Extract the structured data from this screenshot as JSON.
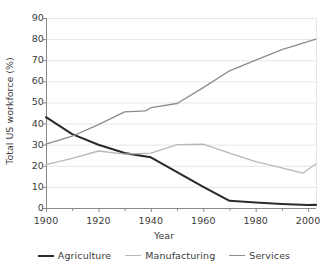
{
  "chart_data": {
    "type": "line",
    "title": "",
    "xlabel": "Year",
    "ylabel": "Total US workforce (%)",
    "xlim": [
      1900,
      2003
    ],
    "ylim": [
      0,
      90
    ],
    "xticks": [
      1900,
      1920,
      1940,
      1960,
      1980,
      2000
    ],
    "yticks": [
      0,
      10,
      20,
      30,
      40,
      50,
      60,
      70,
      80,
      90
    ],
    "grid": "horizontal",
    "legend_position": "bottom",
    "series": [
      {
        "name": "Agriculture",
        "color": "#2b2b2b",
        "width": 2.1,
        "x": [
          1900,
          1910,
          1920,
          1930,
          1940,
          1950,
          1960,
          1970,
          1980,
          1990,
          2000,
          2003
        ],
        "values": [
          43,
          35,
          30,
          26,
          24,
          17,
          10,
          3.4,
          2.6,
          1.9,
          1.4,
          1.5
        ]
      },
      {
        "name": "Manufacturing",
        "color": "#b8b8b8",
        "width": 1.3,
        "x": [
          1900,
          1910,
          1920,
          1930,
          1940,
          1950,
          1960,
          1970,
          1980,
          1990,
          1998,
          2003
        ],
        "values": [
          20.5,
          23.5,
          27,
          25.5,
          26,
          30,
          30.2,
          26,
          22,
          19,
          16.5,
          21
        ]
      },
      {
        "name": "Services",
        "color": "#8c8c8c",
        "width": 1.3,
        "x": [
          1900,
          1910,
          1920,
          1930,
          1938,
          1940,
          1950,
          1960,
          1970,
          1980,
          1990,
          2003
        ],
        "values": [
          30.2,
          34,
          39.5,
          45.5,
          46,
          47.5,
          49.5,
          57,
          65,
          70,
          75,
          80
        ]
      }
    ]
  },
  "axes": {
    "y_tick_labels": [
      "90",
      "80",
      "70",
      "60",
      "50",
      "40",
      "30",
      "20",
      "10",
      "0"
    ],
    "x_tick_labels": [
      "1900",
      "1920",
      "1940",
      "1960",
      "1980",
      "2000"
    ],
    "y_axis_title": "Total US workforce (%)",
    "x_axis_title": "Year"
  },
  "legend": {
    "items": [
      {
        "label": "Agriculture",
        "color": "#2b2b2b",
        "width": 2.1
      },
      {
        "label": "Manufacturing",
        "color": "#b8b8b8",
        "width": 1.3
      },
      {
        "label": "Services",
        "color": "#8c8c8c",
        "width": 1.3
      }
    ]
  },
  "style": {
    "background": "#ffffff",
    "grid_color": "#e6e6e6",
    "axis_color": "#8a8a8a",
    "text_color": "#3b3b3b"
  }
}
